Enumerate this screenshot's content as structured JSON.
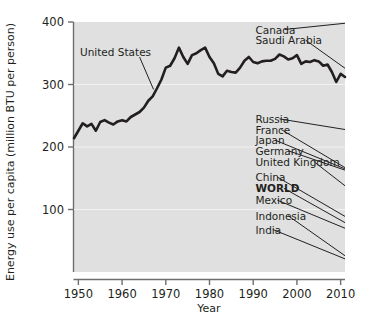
{
  "chart_data": {
    "type": "line",
    "title": "",
    "xlabel": "Year",
    "ylabel": "Energy use per capita (million BTU per person)",
    "xlim": [
      1949,
      2011
    ],
    "ylim": [
      0,
      400
    ],
    "xticks": [
      1950,
      1960,
      1970,
      1980,
      1990,
      2000,
      2010
    ],
    "xtick_labels": [
      "1950",
      "1960",
      "1970",
      "1980",
      "1990",
      "2000",
      "2010"
    ],
    "yticks": [
      100,
      200,
      300,
      400
    ],
    "ytick_labels": [
      "100",
      "200",
      "300",
      "400"
    ],
    "grid": false,
    "legend_position": "right-inline-labels",
    "plot_background": "#e0e0e0",
    "line_color": "#231f20",
    "annotations": [
      {
        "text": "United States",
        "label_x": 1958.5,
        "label_y": 352,
        "leader_from": [
          1964.0,
          344
        ],
        "leader_to": [
          1967.2,
          292
        ]
      }
    ],
    "series": [
      {
        "name": "United States",
        "emphasis": "thick",
        "label_x": 1958.5,
        "label_y": 352,
        "x": [
          1949,
          1950,
          1951,
          1952,
          1953,
          1954,
          1955,
          1956,
          1957,
          1958,
          1959,
          1960,
          1961,
          1962,
          1963,
          1964,
          1965,
          1966,
          1967,
          1968,
          1969,
          1970,
          1971,
          1972,
          1973,
          1974,
          1975,
          1976,
          1977,
          1978,
          1979,
          1980,
          1981,
          1982,
          1983,
          1984,
          1985,
          1986,
          1987,
          1988,
          1989,
          1990,
          1991,
          1992,
          1993,
          1994,
          1995,
          1996,
          1997,
          1998,
          1999,
          2000,
          2001,
          2002,
          2003,
          2004,
          2005,
          2006,
          2007,
          2008,
          2009,
          2010,
          2011
        ],
        "y": [
          214,
          226,
          238,
          233,
          237,
          226,
          240,
          243,
          239,
          236,
          241,
          243,
          241,
          248,
          252,
          256,
          263,
          274,
          281,
          294,
          308,
          327,
          330,
          342,
          359,
          344,
          333,
          347,
          350,
          355,
          359,
          344,
          334,
          317,
          313,
          322,
          320,
          319,
          327,
          338,
          344,
          336,
          334,
          337,
          338,
          338,
          341,
          348,
          345,
          340,
          342,
          347,
          333,
          337,
          336,
          339,
          337,
          330,
          332,
          320,
          304,
          317,
          312
        ]
      },
      {
        "name": "Canada",
        "label_x": 1990.5,
        "label_y": 388,
        "leader_from": [
          1997.2,
          388
        ],
        "leader_to": [
          2011.0,
          398
        ],
        "x": [
          2011
        ],
        "y": [
          398
        ]
      },
      {
        "name": "Saudi Arabia",
        "label_x": 1990.5,
        "label_y": 371,
        "leader_from": [
          2002.0,
          371
        ],
        "leader_to": [
          2011.0,
          326
        ],
        "x": [
          2011
        ],
        "y": [
          326
        ]
      },
      {
        "name": "Russia",
        "label_x": 1990.5,
        "label_y": 245,
        "leader_from": [
          1996.0,
          245
        ],
        "leader_to": [
          2011.0,
          228
        ],
        "x": [
          2011
        ],
        "y": [
          228
        ]
      },
      {
        "name": "France",
        "label_x": 1990.5,
        "label_y": 228,
        "leader_from": [
          1996.4,
          228
        ],
        "leader_to": [
          2011.0,
          167
        ],
        "x": [
          2011
        ],
        "y": [
          167
        ]
      },
      {
        "name": "Japan",
        "label_x": 1990.5,
        "label_y": 211,
        "leader_from": [
          1995.0,
          211
        ],
        "leader_to": [
          2011.0,
          165
        ],
        "x": [
          2011
        ],
        "y": [
          165
        ]
      },
      {
        "name": "Germany",
        "label_x": 1990.5,
        "label_y": 194,
        "leader_from": [
          1998.0,
          194
        ],
        "leader_to": [
          2011.0,
          163
        ],
        "x": [
          2011
        ],
        "y": [
          163
        ]
      },
      {
        "name": "United Kingdom",
        "label_x": 1990.5,
        "label_y": 176,
        "leader_from": [
          2004.0,
          176
        ],
        "leader_to": [
          2011.0,
          138
        ],
        "x": [
          2011
        ],
        "y": [
          138
        ]
      },
      {
        "name": "China",
        "label_x": 1990.5,
        "label_y": 152,
        "leader_from": [
          1995.5,
          152
        ],
        "leader_to": [
          2011.0,
          89
        ],
        "x": [
          2011
        ],
        "y": [
          89
        ]
      },
      {
        "name": "WORLD",
        "emphasis": "bold-label",
        "label_x": 1990.5,
        "label_y": 134,
        "leader_from": [
          1997.0,
          134
        ],
        "leader_to": [
          2011.0,
          79
        ],
        "x": [
          2011
        ],
        "y": [
          79
        ]
      },
      {
        "name": "Mexico",
        "label_x": 1990.5,
        "label_y": 115,
        "leader_from": [
          1995.5,
          115
        ],
        "leader_to": [
          2011.0,
          70
        ],
        "x": [
          2011
        ],
        "y": [
          70
        ]
      },
      {
        "name": "Indonesia",
        "label_x": 1990.5,
        "label_y": 90,
        "leader_from": [
          1998.0,
          90
        ],
        "leader_to": [
          2011.0,
          26
        ],
        "x": [
          2011
        ],
        "y": [
          26
        ]
      },
      {
        "name": "India",
        "label_x": 1990.5,
        "label_y": 68,
        "leader_from": [
          1994.5,
          68
        ],
        "leader_to": [
          2011.0,
          21
        ],
        "x": [
          2011
        ],
        "y": [
          21
        ]
      }
    ]
  },
  "axes": {
    "x_title": "Year",
    "y_title": "Energy use per capita (million BTU per person)",
    "x_tick_labels": [
      "1950",
      "1960",
      "1970",
      "1980",
      "1990",
      "2000",
      "2010"
    ],
    "y_tick_labels": [
      "100",
      "200",
      "300",
      "400"
    ]
  },
  "series_labels": {
    "us": "United States",
    "canada": "Canada",
    "saudi_arabia": "Saudi Arabia",
    "russia": "Russia",
    "france": "France",
    "japan": "Japan",
    "germany": "Germany",
    "united_kingdom": "United Kingdom",
    "china": "China",
    "world": "WORLD",
    "mexico": "Mexico",
    "indonesia": "Indonesia",
    "india": "India"
  },
  "colors": {
    "ink": "#231f20",
    "plot_bg": "#e0e0e0",
    "page_bg": "#ffffff",
    "axis": "#6d6e71"
  }
}
